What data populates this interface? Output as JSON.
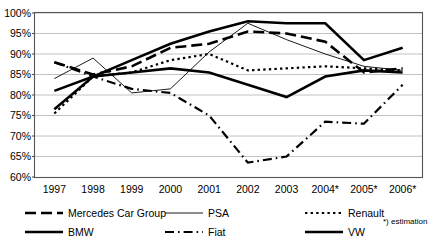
{
  "chart_data": {
    "type": "line",
    "title": "",
    "xlabel": "",
    "ylabel": "",
    "ylim": [
      60,
      100
    ],
    "xlim": [
      1997,
      2006
    ],
    "grid": true,
    "legend_position": "bottom",
    "categories": [
      "1997",
      "1998",
      "1999",
      "2000",
      "2001",
      "2002",
      "2003",
      "2004*",
      "2005*",
      "2006*"
    ],
    "y_ticks": [
      "60%",
      "65%",
      "70%",
      "75%",
      "80%",
      "85%",
      "90%",
      "95%",
      "100%"
    ],
    "y_tick_values": [
      60,
      65,
      70,
      75,
      80,
      85,
      90,
      95,
      100
    ],
    "footnote": "*) estimation",
    "series": [
      {
        "name": "Mercedes Car Group",
        "style": "long-dash",
        "values": [
          88.0,
          85.0,
          87.0,
          91.5,
          92.5,
          95.5,
          95.0,
          93.0,
          85.5,
          86.5
        ]
      },
      {
        "name": "BMW",
        "style": "thick-solid",
        "values": [
          76.5,
          84.5,
          88.5,
          92.5,
          95.5,
          98.0,
          97.5,
          97.5,
          88.5,
          91.5
        ]
      },
      {
        "name": "PSA",
        "style": "thin-solid",
        "values": [
          84.0,
          89.0,
          80.5,
          81.5,
          90.5,
          97.5,
          93.5,
          90.0,
          87.0,
          86.0
        ]
      },
      {
        "name": "Fiat",
        "style": "dash-dot",
        "values": [
          88.0,
          84.5,
          81.5,
          80.5,
          75.0,
          63.5,
          65.0,
          73.5,
          73.0,
          82.5
        ]
      },
      {
        "name": "Renault",
        "style": "dotted",
        "values": [
          75.5,
          84.5,
          85.5,
          88.5,
          90.0,
          86.0,
          86.5,
          87.0,
          86.5,
          86.0
        ]
      },
      {
        "name": "VW",
        "style": "thick-solid",
        "values": [
          81.0,
          84.5,
          85.5,
          86.5,
          85.5,
          82.5,
          79.5,
          84.5,
          86.0,
          85.5
        ]
      }
    ]
  },
  "legend": {
    "items": [
      {
        "label": "Mercedes Car Group",
        "style": "long-dash"
      },
      {
        "label": "BMW",
        "style": "thick-solid"
      },
      {
        "label": "PSA",
        "style": "thin-solid"
      },
      {
        "label": "Fiat",
        "style": "dash-dot"
      },
      {
        "label": "Renault",
        "style": "dotted"
      },
      {
        "label": "VW",
        "style": "thick-solid"
      }
    ],
    "footnote": "*) estimation"
  },
  "colors": {
    "line": "#000000",
    "grid": "#b3b3b3",
    "axis": "#555555",
    "background": "#ffffff"
  }
}
